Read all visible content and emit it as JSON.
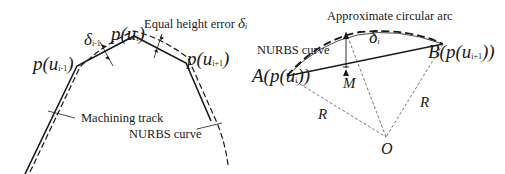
{
  "figure_left": {
    "title": "Equal height error segmentation",
    "labels": {
      "p_prev": {
        "base": "p(u",
        "sub": "i-1",
        "close": ")"
      },
      "p_curr": {
        "base": "p(u",
        "sub": "i",
        "close": ")"
      },
      "p_next": {
        "base": "p(u",
        "sub": "i+1",
        "close": ")"
      },
      "delta_prev": {
        "base": "δ",
        "sub": "i-1"
      },
      "equal_height_error": "Equal height error",
      "equal_height_symbol": "δ",
      "equal_height_symbol_sub": "i",
      "machining_track": "Machining track",
      "nurbs_curve": "NURBS curve"
    }
  },
  "figure_right": {
    "title": "Approximate circular arc construction",
    "labels": {
      "approx_arc": "Approximate circular arc",
      "nurbs_curve": "NURBS curve",
      "point_a": {
        "prefix": "A(p(u",
        "sub": "i",
        "close": "))"
      },
      "point_b": {
        "prefix": "B(p(u",
        "sub": "i+1",
        "close": "))"
      },
      "delta": {
        "base": "δ",
        "sub": "i"
      },
      "midpoint": "M",
      "radius_left": "R",
      "radius_right": "R",
      "center": "O"
    }
  },
  "colors": {
    "line": "#1a1a1a",
    "thin_line": "#555555",
    "background": "#ffffff"
  }
}
